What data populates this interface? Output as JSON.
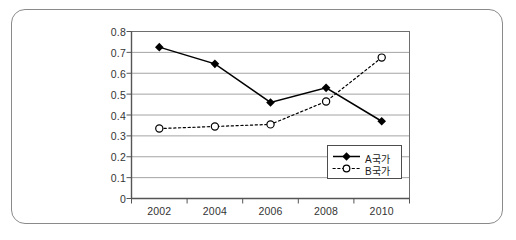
{
  "chart_data": {
    "type": "line",
    "title": "",
    "subtitle": "",
    "xlabel": "",
    "ylabel": "",
    "categories": [
      "2002",
      "2004",
      "2006",
      "2008",
      "2010"
    ],
    "x": [
      2002,
      2004,
      2006,
      2008,
      2010
    ],
    "xlim": [
      2001,
      2011
    ],
    "ylim": [
      0,
      0.8
    ],
    "y_ticks": [
      "0",
      "0.1",
      "0.2",
      "0.3",
      "0.4",
      "0.5",
      "0.6",
      "0.7",
      "0.8"
    ],
    "y_tick_values": [
      0,
      0.1,
      0.2,
      0.3,
      0.4,
      0.5,
      0.6,
      0.7,
      0.8
    ],
    "x_ticks": [
      "2002",
      "2004",
      "2006",
      "2008",
      "2010"
    ],
    "grid": "horizontal",
    "legend_position": "inside-bottom-right",
    "series": [
      {
        "name": "A국가",
        "values": [
          0.725,
          0.645,
          0.46,
          0.53,
          0.37
        ],
        "line_style": "solid",
        "marker": "filled-diamond",
        "color": "#000000"
      },
      {
        "name": "B국가",
        "values": [
          0.335,
          0.345,
          0.355,
          0.465,
          0.675
        ],
        "line_style": "dotted",
        "marker": "hollow-circle",
        "color": "#000000"
      }
    ],
    "colors": {
      "plot_border": "#6e6e6e",
      "grid_line": "#9a9a9a",
      "axis_line": "#555555",
      "frame_border": "#8a8a8a",
      "text": "#333333",
      "background": "#ffffff"
    }
  },
  "legend": {
    "items": [
      {
        "label": "A국가"
      },
      {
        "label": "B국가"
      }
    ]
  },
  "axes": {
    "y_labels": [
      "0.8",
      "0.7",
      "0.6",
      "0.5",
      "0.4",
      "0.3",
      "0.2",
      "0.1",
      "0"
    ],
    "x_labels": [
      "2002",
      "2004",
      "2006",
      "2008",
      "2010"
    ]
  }
}
